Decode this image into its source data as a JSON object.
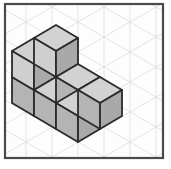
{
  "figure": {
    "frame": {
      "x": 5,
      "y": 4,
      "width": 158,
      "height": 154,
      "stroke_color": "#4a4a4a",
      "stroke_width": 2.2,
      "fill_color": "#fdfdfd"
    },
    "grid": {
      "visible": true,
      "type": "isometric-triangular",
      "line_color": "#d8d8d8",
      "line_width": 0.7,
      "cell_width": 26,
      "cell_height": 15
    },
    "shading": {
      "top_face_color": "#d2d2d2",
      "left_face_color": "#cfcfcf",
      "right_face_color": "#a9a9a9",
      "front_left_lower_color": "#b4b4b4",
      "edge_color": "#2b2b2b",
      "edge_width": 1.8
    },
    "geometry": {
      "origin_x": 78,
      "origin_y": 142,
      "unit_half_width": 22,
      "unit_half_height": 13,
      "unit_height": 26,
      "cube_count": 8,
      "apex_point": [
        100,
        20
      ],
      "left_point": [
        32,
        77
      ],
      "right_point": [
        144,
        90
      ],
      "bottom_point": [
        78,
        142
      ]
    },
    "cubes": [
      {
        "name": "bottom-front-left",
        "x": 0,
        "y": 0,
        "z": 0
      },
      {
        "name": "bottom-front-right",
        "x": 1,
        "y": 0,
        "z": 0
      },
      {
        "name": "bottom-back-left",
        "x": 0,
        "y": 1,
        "z": 0
      },
      {
        "name": "bottom-back-right",
        "x": 1,
        "y": 1,
        "z": 0
      },
      {
        "name": "bottom-rear-left",
        "x": 0,
        "y": 2,
        "z": 0
      },
      {
        "name": "bottom-rear-right",
        "x": 1,
        "y": 2,
        "z": 0
      },
      {
        "name": "top-back-left",
        "x": 0,
        "y": 2,
        "z": 1
      },
      {
        "name": "top-back-right",
        "x": 1,
        "y": 2,
        "z": 1
      }
    ]
  }
}
